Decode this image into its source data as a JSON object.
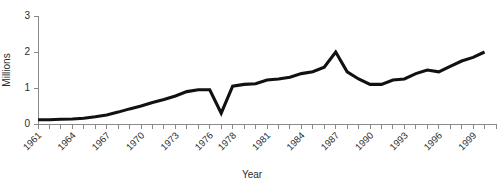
{
  "chart_data": {
    "type": "line",
    "title": "",
    "xlabel": "Year",
    "ylabel": "Millions",
    "xlim": [
      1961,
      2001
    ],
    "ylim": [
      0,
      3
    ],
    "grid": false,
    "legend": null,
    "yticks": [
      0,
      1,
      2,
      3
    ],
    "ytick_labels": [
      "0",
      "1",
      "2",
      "3"
    ],
    "xtick_labels": [
      "1961",
      "1964",
      "1967",
      "1970",
      "1973",
      "1976",
      "1978",
      "1981",
      "1984",
      "1987",
      "1990",
      "1993",
      "1996",
      "1999"
    ],
    "xtick_values": [
      1961,
      1964,
      1967,
      1970,
      1973,
      1976,
      1978,
      1981,
      1984,
      1987,
      1990,
      1993,
      1996,
      1999
    ],
    "xtick_minor_step": 1,
    "series": [
      {
        "name": "Millions",
        "color": "#111111",
        "x": [
          1961,
          1962,
          1963,
          1964,
          1965,
          1966,
          1967,
          1968,
          1969,
          1970,
          1971,
          1972,
          1973,
          1974,
          1975,
          1976,
          1977,
          1978,
          1979,
          1980,
          1981,
          1982,
          1983,
          1984,
          1985,
          1986,
          1987,
          1988,
          1989,
          1990,
          1991,
          1992,
          1993,
          1994,
          1995,
          1996,
          1997,
          1998,
          1999,
          2000
        ],
        "values": [
          0.12,
          0.12,
          0.13,
          0.14,
          0.16,
          0.2,
          0.25,
          0.33,
          0.42,
          0.5,
          0.6,
          0.68,
          0.78,
          0.9,
          0.95,
          0.95,
          0.3,
          1.05,
          1.1,
          1.12,
          1.22,
          1.25,
          1.3,
          1.4,
          1.45,
          1.58,
          2.0,
          1.45,
          1.25,
          1.1,
          1.1,
          1.22,
          1.25,
          1.4,
          1.5,
          1.45,
          1.6,
          1.75,
          1.85,
          2.0
        ]
      }
    ]
  },
  "axis": {
    "y_title": "Millions",
    "x_title": "Year"
  }
}
